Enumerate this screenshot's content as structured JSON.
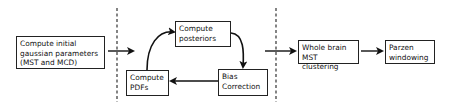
{
  "diagram": {
    "stages": [
      {
        "id": "init",
        "label": "Compute initial\ngaussian parameters\n(MST and MCD)"
      },
      {
        "id": "posteriors",
        "label": "Compute\nposteriors"
      },
      {
        "id": "bias",
        "label": "Bias\nCorrection"
      },
      {
        "id": "pdfs",
        "label": "Compute\nPDFs"
      },
      {
        "id": "mst",
        "label": "Whole brain\nMST clustering"
      },
      {
        "id": "parzen",
        "label": "Parzen\nwindowing"
      }
    ],
    "edges": [
      {
        "from": "init",
        "to": "loop"
      },
      {
        "from": "pdfs",
        "to": "posteriors"
      },
      {
        "from": "posteriors",
        "to": "bias"
      },
      {
        "from": "bias",
        "to": "pdfs"
      },
      {
        "from": "loop",
        "to": "mst"
      },
      {
        "from": "mst",
        "to": "parzen"
      }
    ],
    "separators": 2,
    "colors": {
      "stroke": "#111111",
      "box_border": "#222222",
      "background": "#ffffff"
    }
  }
}
